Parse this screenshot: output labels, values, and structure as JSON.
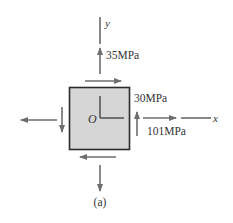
{
  "diagram": {
    "caption": "(a)",
    "colors": {
      "arrow": "#6e6e6e",
      "axis": "#555555",
      "element_fill": "#d6d6d6",
      "element_border": "#2b2b2b",
      "text": "#333333"
    },
    "axes": {
      "x_label": "x",
      "y_label": "y",
      "origin_label": "O"
    },
    "stresses": {
      "sigma_y": "35MPa",
      "tau_xy": "30MPa",
      "sigma_x": "101MPa"
    }
  }
}
